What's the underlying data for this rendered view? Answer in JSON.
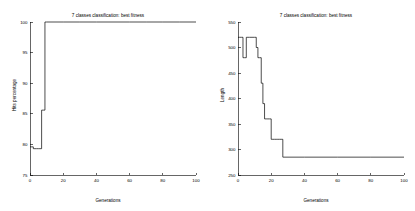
{
  "figure": {
    "background": "#ffffff",
    "line_color": "#000000",
    "panel_count": 2
  },
  "chart_data": [
    {
      "type": "line",
      "id": "hits-percentage",
      "title": "7 classes classification: best fitness",
      "xlabel": "Generations",
      "ylabel": "Hits percentage",
      "xlim": [
        0,
        100
      ],
      "ylim": [
        75,
        100
      ],
      "xticks": [
        0,
        20,
        40,
        60,
        80,
        100
      ],
      "xticklabels": [
        "0",
        "20",
        "40",
        "60",
        "80",
        "100"
      ],
      "yticks": [
        75,
        80,
        85,
        90,
        95,
        100
      ],
      "yticklabels": [
        "75",
        "80",
        "85",
        "90",
        "95",
        "100"
      ],
      "grid": false,
      "legend": false,
      "series": [
        {
          "name": "best fitness",
          "x": [
            0,
            1,
            2,
            3,
            4,
            5,
            6,
            7,
            8,
            9,
            10,
            20,
            30,
            40,
            50,
            60,
            70,
            80,
            90,
            100
          ],
          "values": [
            79.6,
            79.6,
            79.3,
            79.3,
            79.3,
            79.3,
            79.3,
            85.6,
            85.6,
            100,
            100,
            100,
            100,
            100,
            100,
            100,
            100,
            100,
            100,
            100
          ]
        }
      ]
    },
    {
      "type": "line",
      "id": "length",
      "title": "7 classes classification: best fitness",
      "xlabel": "Generations",
      "ylabel": "Length",
      "xlim": [
        0,
        100
      ],
      "ylim": [
        250,
        550
      ],
      "xticks": [
        0,
        20,
        40,
        60,
        80,
        100
      ],
      "xticklabels": [
        "0",
        "20",
        "40",
        "60",
        "80",
        "100"
      ],
      "yticks": [
        250,
        300,
        350,
        400,
        450,
        500,
        550
      ],
      "yticklabels": [
        "250",
        "300",
        "350",
        "400",
        "450",
        "500",
        "550"
      ],
      "grid": false,
      "legend": false,
      "series": [
        {
          "name": "best length",
          "x": [
            0,
            1,
            2,
            3,
            4,
            5,
            6,
            7,
            10,
            11,
            12,
            13,
            14,
            15,
            16,
            17,
            18,
            19,
            20,
            21,
            22,
            23,
            24,
            25,
            26,
            27,
            40,
            60,
            80,
            100
          ],
          "values": [
            520,
            520,
            520,
            480,
            480,
            520,
            520,
            520,
            520,
            500,
            480,
            480,
            430,
            390,
            360,
            360,
            360,
            360,
            320,
            320,
            320,
            320,
            320,
            320,
            320,
            285,
            285,
            285,
            285,
            285
          ]
        }
      ]
    }
  ]
}
